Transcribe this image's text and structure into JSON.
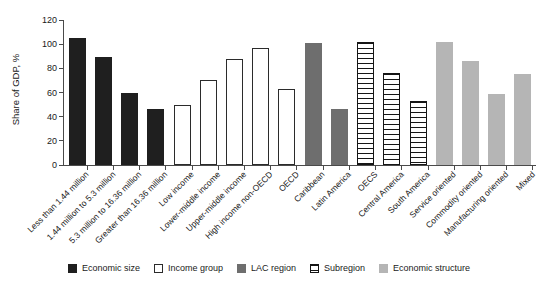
{
  "chart_data": {
    "type": "bar",
    "title": "",
    "xlabel": "",
    "ylabel": "Share of GDP, %",
    "ylim": [
      0,
      120
    ],
    "yticks": [
      0,
      20,
      40,
      60,
      80,
      100,
      120
    ],
    "grid": false,
    "legend_position": "bottom",
    "categories": [
      "Less than 1.44 million",
      "1.44 million to 5.3 million",
      "5.3 million to 16.36 million",
      "Greater than 16.36 million",
      "Low income",
      "Lower-middle income",
      "Upper-middle income",
      "High income non-OECD",
      "OECD",
      "Caribbean",
      "Latin America",
      "OECS",
      "Central America",
      "South America",
      "Service oriented",
      "Commodity oriented",
      "Manufacturing oriented",
      "Mixed"
    ],
    "values": [
      105,
      89,
      60,
      46,
      50,
      70,
      88,
      97,
      63,
      101,
      46,
      102,
      76,
      53,
      102,
      86,
      59,
      75
    ],
    "bar_groups": [
      "Economic size",
      "Economic size",
      "Economic size",
      "Economic size",
      "Income group",
      "Income group",
      "Income group",
      "Income group",
      "Income group",
      "LAC region",
      "LAC region",
      "Subregion",
      "Subregion",
      "Subregion",
      "Economic structure",
      "Economic structure",
      "Economic structure",
      "Economic structure"
    ],
    "legend": [
      {
        "label": "Economic size",
        "style": "solid-black",
        "color": "#1f1f1f"
      },
      {
        "label": "Income group",
        "style": "white-outline",
        "color": "#ffffff"
      },
      {
        "label": "LAC region",
        "style": "solid-dark-gray",
        "color": "#6e6e6e"
      },
      {
        "label": "Subregion",
        "style": "horizontal-hatch",
        "color": "#151515"
      },
      {
        "label": "Economic structure",
        "style": "solid-light-gray",
        "color": "#b5b5b5"
      }
    ]
  }
}
